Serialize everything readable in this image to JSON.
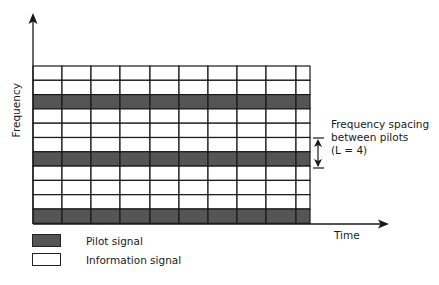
{
  "diagram": {
    "y_axis_label": "Frequency",
    "x_axis_label": "Time",
    "grid": {
      "rows": [
        "info",
        "info",
        "pilot",
        "info",
        "info",
        "info",
        "pilot",
        "info",
        "info",
        "info",
        "pilot"
      ],
      "column_boundaries_px": [
        33,
        62,
        91,
        120,
        150,
        179,
        208,
        237,
        266,
        296,
        310
      ],
      "top_px": 66,
      "row_height_px": 14.3
    },
    "annotation": {
      "line1": "Frequency spacing",
      "line2": "between pilots",
      "line3": "(L = 4)"
    },
    "legend": [
      {
        "label": "Pilot signal",
        "type": "pilot"
      },
      {
        "label": "Information signal",
        "type": "info"
      }
    ],
    "colors": {
      "pilot": "#555555",
      "info": "#ffffff",
      "lines": "#1a1a1a"
    }
  }
}
